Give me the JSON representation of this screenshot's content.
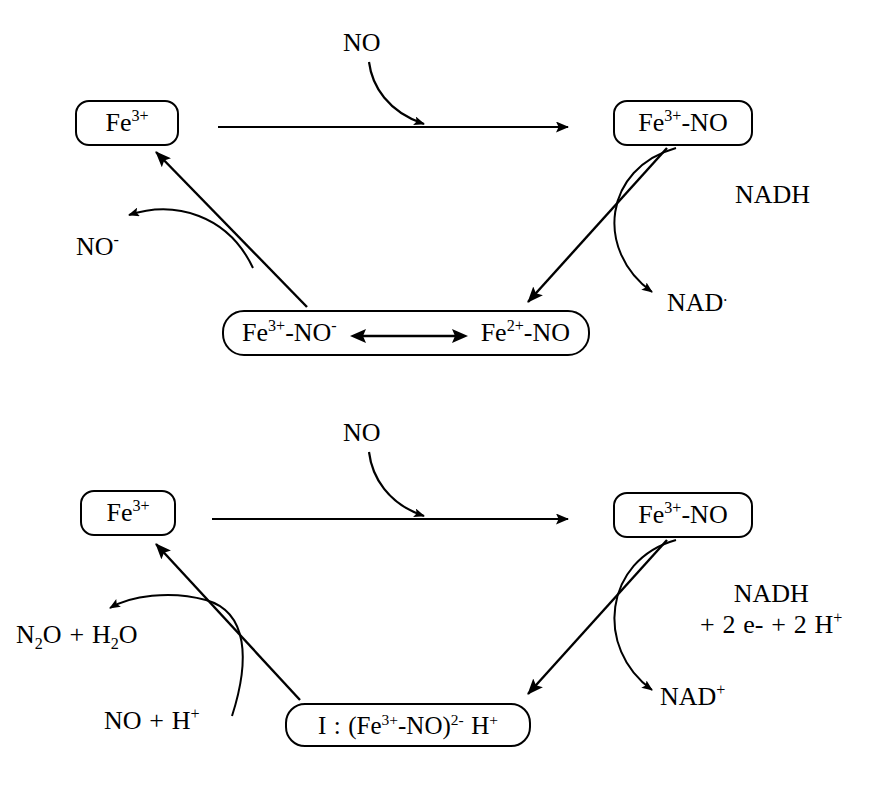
{
  "diagram": {
    "type": "reaction-cycle-schematic",
    "title_text": "",
    "stroke_color": "#000000",
    "background_color": "#ffffff",
    "panels": [
      {
        "id": "top-cycle",
        "nodes": {
          "ferric": "Fe3+",
          "ferric_nitrosyl": "Fe3+-NO",
          "intermediate_left": "Fe3+-NO-",
          "intermediate_right": "Fe2+-NO",
          "resonance_symbol": "double-headed-arrow"
        },
        "labels": {
          "substrate_in": "NO",
          "product_out": "NO-",
          "cofactor_in": "NADH",
          "cofactor_out": "NAD"
        }
      },
      {
        "id": "bottom-cycle",
        "nodes": {
          "ferric": "Fe3+",
          "ferric_nitrosyl": "Fe3+-NO",
          "intermediate": "I : (Fe3+-NO)2- H+"
        },
        "labels": {
          "substrate_in": "NO",
          "product_out": "N2O + H2O",
          "reactant_in": "NO + H+",
          "cofactor_in_line1": "NADH",
          "cofactor_in_line2": "+ 2 e- + 2 H+",
          "cofactor_out": "NAD+"
        }
      }
    ]
  }
}
